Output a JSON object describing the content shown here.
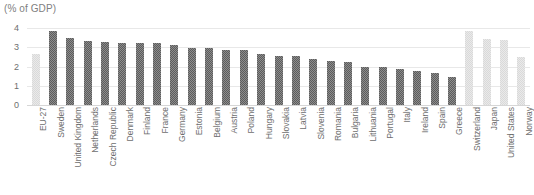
{
  "chart_data": {
    "type": "bar",
    "title": "(% of GDP)",
    "xlabel": "",
    "ylabel": "",
    "ylim": [
      0,
      4
    ],
    "yticks": [
      0,
      1,
      2,
      3,
      4
    ],
    "grid": true,
    "legend": "none",
    "categories": [
      "EU-27",
      "Sweden",
      "United Kingdom",
      "Netherlands",
      "Czech Republic",
      "Denmark",
      "Finland",
      "France",
      "Germany",
      "Estonia",
      "Belgium",
      "Austria",
      "Poland",
      "Hungary",
      "Slovakia",
      "Latvia",
      "Slovenia",
      "Romania",
      "Bulgaria",
      "Lithuania",
      "Portugal",
      "Italy",
      "Ireland",
      "Spain",
      "Greece",
      "Switzerland",
      "Japan",
      "United States",
      "Norway"
    ],
    "values": [
      2.65,
      3.85,
      3.5,
      3.3,
      3.25,
      3.22,
      3.22,
      3.2,
      3.1,
      2.95,
      2.95,
      2.85,
      2.85,
      2.65,
      2.55,
      2.55,
      2.4,
      2.3,
      2.25,
      2.0,
      1.95,
      1.85,
      1.75,
      1.65,
      1.45,
      3.85,
      3.45,
      3.4,
      2.5
    ],
    "bar_styles": [
      "light",
      "dark",
      "dark",
      "dark",
      "dark",
      "dark",
      "dark",
      "dark",
      "dark",
      "dark",
      "dark",
      "dark",
      "dark",
      "dark",
      "dark",
      "dark",
      "dark",
      "dark",
      "dark",
      "dark",
      "dark",
      "dark",
      "dark",
      "dark",
      "dark",
      "light",
      "light",
      "light",
      "light"
    ],
    "colors": {
      "dark_bar": "#5c5c5c",
      "light_bar": "#d9d9d9",
      "gridline": "#e8e8e8",
      "baseline": "#d6d6d6",
      "text": "#6e6e6e",
      "title_text": "#808080"
    }
  }
}
